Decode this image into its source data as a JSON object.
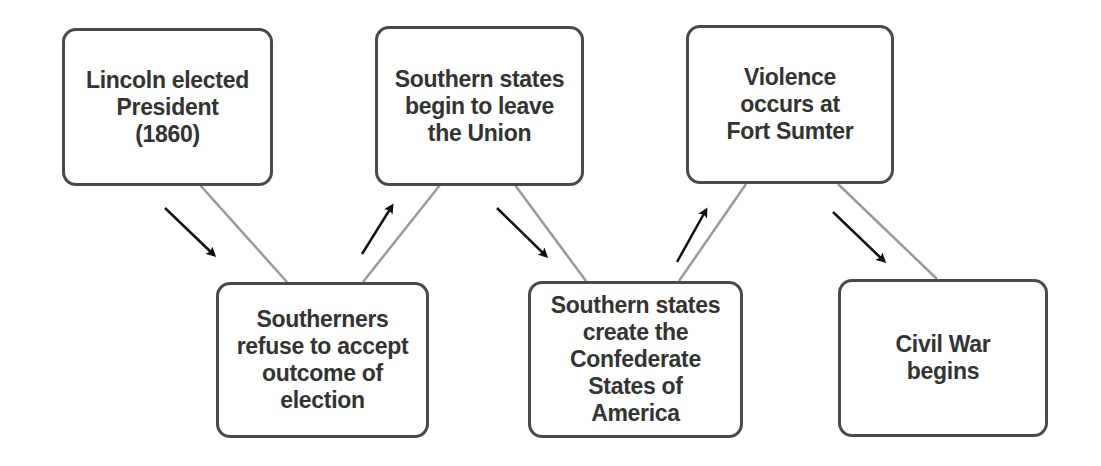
{
  "diagram": {
    "type": "flowchart",
    "title": "",
    "colors": {
      "box_border": "#4a4a4a",
      "text": "#333333",
      "connector": "#9a9a9a",
      "arrow": "#111111",
      "background": "#ffffff"
    },
    "nodes": [
      {
        "id": "n1",
        "label": "Lincoln elected\nPresident\n(1860)"
      },
      {
        "id": "n2",
        "label": "Southerners\nrefuse to accept\noutcome of\nelection"
      },
      {
        "id": "n3",
        "label": "Southern states\nbegin to leave\nthe Union"
      },
      {
        "id": "n4",
        "label": "Southern states\ncreate the\nConfederate\nStates of\nAmerica"
      },
      {
        "id": "n5",
        "label": "Violence\noccurs at\nFort Sumter"
      },
      {
        "id": "n6",
        "label": "Civil War\nbegins"
      }
    ],
    "edges": [
      {
        "from": "n1",
        "to": "n2",
        "direction": "down-right"
      },
      {
        "from": "n2",
        "to": "n3",
        "direction": "up-right"
      },
      {
        "from": "n3",
        "to": "n4",
        "direction": "down-right"
      },
      {
        "from": "n4",
        "to": "n5",
        "direction": "up-right"
      },
      {
        "from": "n5",
        "to": "n6",
        "direction": "down-right"
      }
    ]
  }
}
